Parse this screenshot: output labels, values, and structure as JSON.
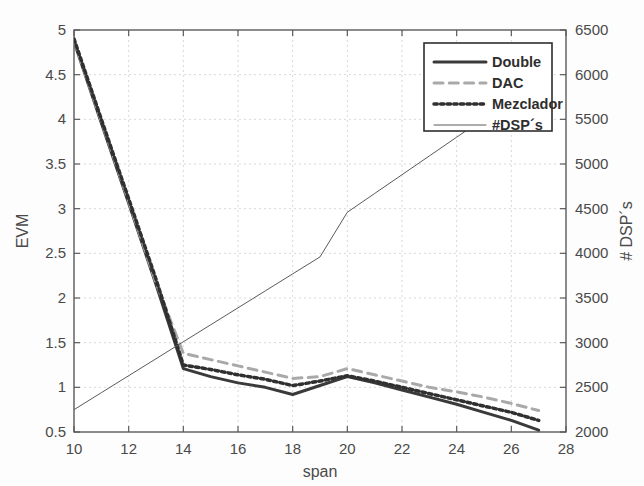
{
  "chart_data": {
    "type": "line",
    "title": "",
    "xlabel": "span",
    "ylabel": "EVM",
    "y2label": "# DSP´s",
    "xlim": [
      10,
      28
    ],
    "ylim": [
      0.5,
      5
    ],
    "y2lim": [
      2000,
      6500
    ],
    "xticks": [
      10,
      12,
      14,
      16,
      18,
      20,
      22,
      24,
      26,
      28
    ],
    "yticks": [
      0.5,
      1,
      1.5,
      2,
      2.5,
      3,
      3.5,
      4,
      4.5,
      5
    ],
    "y2ticks": [
      2000,
      2500,
      3000,
      3500,
      4000,
      4500,
      5000,
      5500,
      6000,
      6500
    ],
    "grid": true,
    "legend_position": "top-right",
    "x": [
      10,
      11,
      12,
      13,
      14,
      15,
      16,
      17,
      18,
      19,
      20,
      21,
      22,
      23,
      24,
      25,
      26,
      27
    ],
    "series": [
      {
        "name": "Double",
        "axis": "left",
        "style": "solid",
        "color": "#3a3a3a",
        "width": 3,
        "values": [
          4.87,
          3.96,
          3.06,
          2.15,
          1.21,
          1.12,
          1.05,
          1.0,
          0.92,
          1.02,
          1.12,
          1.05,
          0.97,
          0.89,
          0.81,
          0.72,
          0.63,
          0.52
        ]
      },
      {
        "name": "DAC",
        "axis": "left",
        "style": "dashed",
        "color": "#a9a9a9",
        "width": 3,
        "values": [
          4.88,
          3.98,
          3.08,
          2.17,
          1.38,
          1.31,
          1.24,
          1.17,
          1.1,
          1.12,
          1.21,
          1.14,
          1.07,
          1.0,
          0.95,
          0.89,
          0.82,
          0.74
        ]
      },
      {
        "name": "Mezclador",
        "axis": "left",
        "style": "dotted",
        "color": "#303030",
        "width": 3.5,
        "values": [
          4.9,
          4.0,
          3.11,
          2.21,
          1.25,
          1.2,
          1.14,
          1.09,
          1.02,
          1.07,
          1.13,
          1.07,
          1.0,
          0.93,
          0.86,
          0.79,
          0.72,
          0.63
        ]
      },
      {
        "name": "#DSP´s",
        "axis": "right",
        "style": "thin-solid",
        "color": "#5a5a5a",
        "width": 1,
        "values": [
          2250,
          2440,
          2630,
          2820,
          3010,
          3200,
          3390,
          3580,
          3770,
          3960,
          4460,
          4670,
          4880,
          5090,
          5300,
          5510,
          5720,
          5930
        ]
      }
    ]
  },
  "legend": {
    "entries": [
      {
        "label": "Double"
      },
      {
        "label": "DAC"
      },
      {
        "label": "Mezclador"
      },
      {
        "label": "#DSP´s"
      }
    ]
  }
}
